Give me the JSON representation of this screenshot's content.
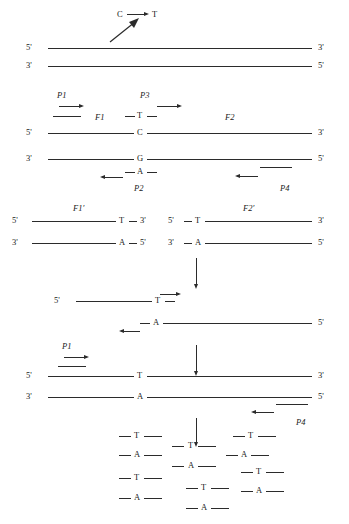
{
  "figure": {
    "type": "diagram",
    "mutation": {
      "from": "C",
      "to": "T",
      "arrow": "→"
    }
  },
  "labels": {
    "five_prime": "5'",
    "three_prime": "3'",
    "base_C": "C",
    "base_G": "G",
    "base_T": "T",
    "base_A": "A",
    "P1": "P1",
    "P2": "P2",
    "P3": "P3",
    "P4": "P4",
    "F1": "F1",
    "F2": "F2",
    "F1p": "F1′",
    "F2p": "F2′"
  },
  "steps": {
    "step1": {
      "name": "template-duplex",
      "top_left": "5'",
      "top_right": "3'",
      "bottom_left": "3'",
      "bottom_right": "5'",
      "mutation_from": "C",
      "mutation_to": "T"
    },
    "step2": {
      "name": "first-round-pcr",
      "primers": [
        "P1",
        "P3",
        "P2",
        "P4"
      ],
      "fragments": [
        "F1",
        "F2"
      ],
      "top_left": "5'",
      "top_right": "3'",
      "bottom_left": "3'",
      "bottom_right": "5'",
      "top_base": "C",
      "bottom_base": "G",
      "primer_top_base": "T",
      "primer_bottom_base": "A"
    },
    "step3": {
      "name": "purified-fragments",
      "left": {
        "label": "F1′",
        "top_left": "5'",
        "top_base": "T",
        "top_right": "3'",
        "bottom_left": "3'",
        "bottom_base": "A",
        "bottom_right": "5'"
      },
      "right": {
        "label": "F2′",
        "top_left": "5'",
        "top_base": "T",
        "top_right": "3'",
        "bottom_left": "3'",
        "bottom_base": "A",
        "bottom_right": "5'"
      }
    },
    "step4": {
      "name": "overlap-anneal",
      "top_left": "5'",
      "top_base": "T",
      "bottom_base": "A",
      "bottom_right": "5'"
    },
    "step5": {
      "name": "extension-and-amplification",
      "primer_left": "P1",
      "primer_right": "P4",
      "top_left": "5'",
      "top_base": "T",
      "top_right": "3'",
      "bottom_left": "3'",
      "bottom_base": "A",
      "bottom_right": "5'"
    },
    "step6": {
      "name": "mutant-product-pool",
      "columns": [
        {
          "bases": [
            "T",
            "A",
            "T",
            "A"
          ]
        },
        {
          "bases": [
            "T",
            "A",
            "T",
            "A"
          ]
        },
        {
          "bases": [
            "T",
            "A",
            "T",
            "A"
          ]
        }
      ]
    }
  }
}
